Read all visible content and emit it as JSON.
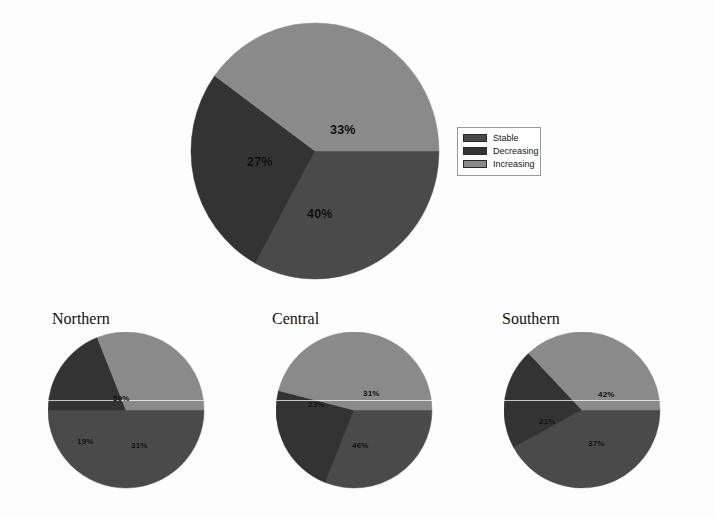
{
  "figure": {
    "title": "",
    "background": "#fdfdfd"
  },
  "colors": {
    "stable": "#4a4a4a",
    "decreasing": "#333333",
    "increasing": "#8a8a8a",
    "label_text": "#0c0c0c",
    "legend_border": "#9a9a9a"
  },
  "legend": {
    "items": [
      {
        "label": "Stable",
        "color": "#4a4a4a",
        "swatch_name": "legend-swatch-stable"
      },
      {
        "label": "Decreasing",
        "color": "#333333",
        "swatch_name": "legend-swatch-decreasing"
      },
      {
        "label": "Increasing",
        "color": "#8a8a8a",
        "swatch_name": "legend-swatch-increasing"
      }
    ]
  },
  "main": {
    "labels": {
      "stable": "33%",
      "decreasing": "27%",
      "increasing": "40%"
    }
  },
  "regions": [
    {
      "name": "Northern",
      "labels": {
        "stable": "50%",
        "decreasing": "19%",
        "increasing": "31%"
      }
    },
    {
      "name": "Central",
      "labels": {
        "stable": "31%",
        "decreasing": "23%",
        "increasing": "46%"
      }
    },
    {
      "name": "Southern",
      "labels": {
        "stable": "42%",
        "decreasing": "21%",
        "increasing": "37%"
      }
    }
  ],
  "chart_data": [
    {
      "type": "pie",
      "title": "Overall",
      "categories": [
        "Stable",
        "Decreasing",
        "Increasing"
      ],
      "values": [
        33,
        27,
        40
      ],
      "labels": [
        "33%",
        "27%",
        "40%"
      ],
      "colors": [
        "#4a4a4a",
        "#333333",
        "#8a8a8a"
      ],
      "legend": [
        "Stable",
        "Decreasing",
        "Increasing"
      ],
      "legend_position": "right",
      "start_angle_deg": 0,
      "direction": "clockwise",
      "units": "percent"
    },
    {
      "type": "pie",
      "title": "Northern",
      "categories": [
        "Stable",
        "Decreasing",
        "Increasing"
      ],
      "values": [
        50,
        19,
        31
      ],
      "labels": [
        "50%",
        "19%",
        "31%"
      ],
      "colors": [
        "#4a4a4a",
        "#333333",
        "#8a8a8a"
      ],
      "legend_position": "none",
      "start_angle_deg": 0,
      "direction": "clockwise",
      "units": "percent"
    },
    {
      "type": "pie",
      "title": "Central",
      "categories": [
        "Stable",
        "Decreasing",
        "Increasing"
      ],
      "values": [
        31,
        23,
        46
      ],
      "labels": [
        "31%",
        "23%",
        "46%"
      ],
      "colors": [
        "#4a4a4a",
        "#333333",
        "#8a8a8a"
      ],
      "legend_position": "none",
      "start_angle_deg": 0,
      "direction": "clockwise",
      "units": "percent"
    },
    {
      "type": "pie",
      "title": "Southern",
      "categories": [
        "Stable",
        "Decreasing",
        "Increasing"
      ],
      "values": [
        42,
        21,
        37
      ],
      "labels": [
        "42%",
        "21%",
        "37%"
      ],
      "colors": [
        "#4a4a4a",
        "#333333",
        "#8a8a8a"
      ],
      "legend_position": "none",
      "start_angle_deg": 0,
      "direction": "clockwise",
      "units": "percent"
    }
  ]
}
